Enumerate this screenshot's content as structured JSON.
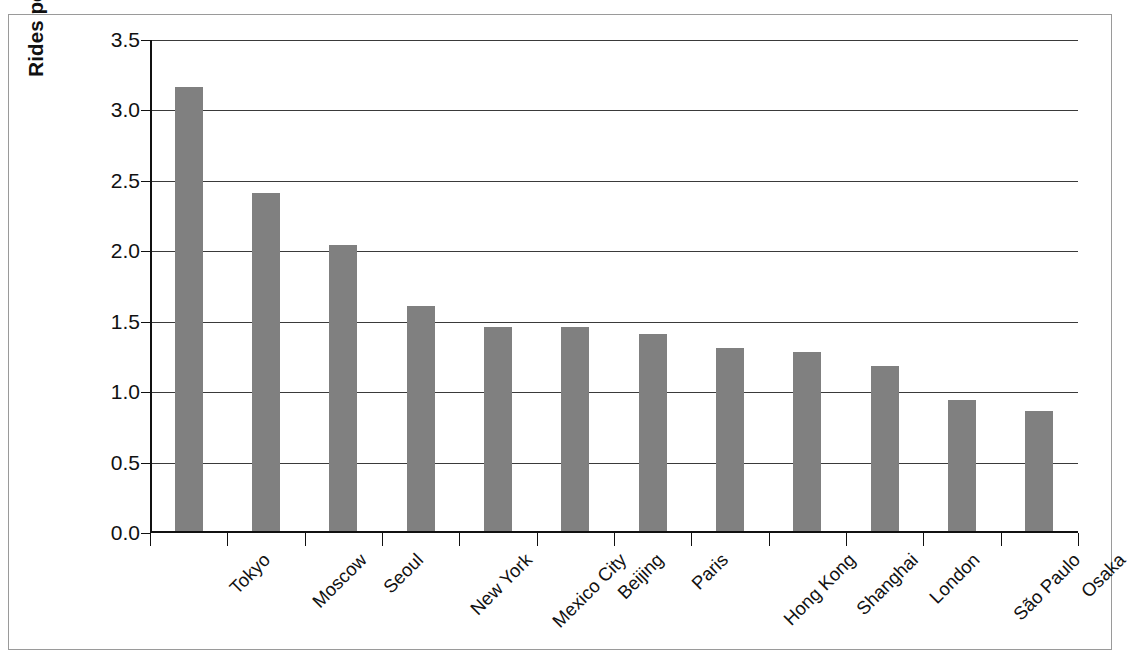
{
  "chart_data": {
    "type": "bar",
    "title": "",
    "xlabel": "",
    "ylabel": "Rides per year in billions",
    "ylim": [
      0.0,
      3.5
    ],
    "yticks": [
      "0.0",
      "0.5",
      "1.0",
      "1.5",
      "2.0",
      "2.5",
      "3.0",
      "3.5"
    ],
    "ytick_values": [
      0.0,
      0.5,
      1.0,
      1.5,
      2.0,
      2.5,
      3.0,
      3.5
    ],
    "grid": "horizontal",
    "legend": "none",
    "bar_color": "#808080",
    "axis_color": "#111111",
    "categories": [
      "Tokyo",
      "Moscow",
      "Seoul",
      "New York",
      "Mexico City",
      "Beijing",
      "Paris",
      "Hong Kong",
      "Shanghai",
      "London",
      "São Paulo",
      "Osaka"
    ],
    "values": [
      3.15,
      2.4,
      2.03,
      1.6,
      1.45,
      1.45,
      1.4,
      1.3,
      1.27,
      1.17,
      0.93,
      0.85
    ]
  }
}
